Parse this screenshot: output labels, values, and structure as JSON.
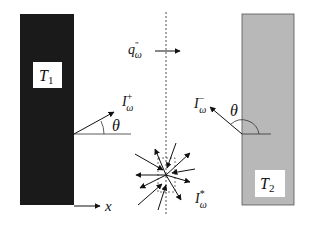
{
  "diagram": {
    "type": "radiative-exchange-between-two-plates",
    "left_wall": {
      "label": "T",
      "subscript": "1",
      "fill": "#1a1a1a"
    },
    "right_wall": {
      "label": "T",
      "subscript": "2",
      "fill": "#b8b8b8"
    },
    "flux": {
      "label": "q",
      "superscript": "\"",
      "subscript": "ω"
    },
    "intensity_forward": {
      "label": "I",
      "superscript": "+",
      "subscript": "ω"
    },
    "intensity_backward": {
      "label": "I",
      "superscript": "−",
      "subscript": "ω"
    },
    "intensity_volume": {
      "label": "I",
      "superscript": "*",
      "subscript": "ω"
    },
    "angle_left": "θ",
    "angle_right": "θ",
    "axis": {
      "label": "x"
    },
    "colors": {
      "ink": "#111111",
      "left_wall": "#1a1a1a",
      "right_wall": "#b8b8b8",
      "right_wall_border": "#555555"
    }
  }
}
